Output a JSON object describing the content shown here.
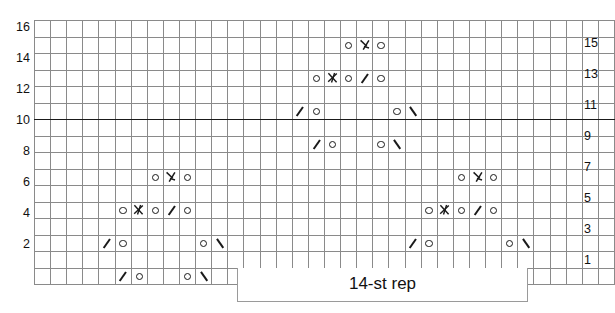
{
  "chart": {
    "type": "knitting-chart-grid",
    "columns": 36,
    "rows": 16,
    "heavy_vertical_after_columns": [
      10,
      23
    ],
    "heavy_horizontal_below_row": 11,
    "grid_color": "#8a8a8a",
    "border_color": "#1a1a1a",
    "row_labels_left": [
      "16",
      "14",
      "12",
      "10",
      "8",
      "6",
      "4",
      "2"
    ],
    "row_labels_right": [
      "15",
      "13",
      "11",
      "9",
      "7",
      "5",
      "3",
      "1"
    ],
    "symbol_legend": {
      "yo": "yarn-over-circle",
      "dec_l": "left-leaning-decrease-backslash",
      "dec_r": "right-leaning-decrease-slash",
      "cdd": "centered-double-decrease-lambda",
      "k3tog": "three-stitch-decrease-arrow"
    },
    "cells": [
      {
        "row": 16,
        "symbols": []
      },
      {
        "row": 15,
        "symbols": [
          {
            "col": 20,
            "type": "yo"
          },
          {
            "col": 21,
            "type": "cdd"
          },
          {
            "col": 22,
            "type": "yo"
          }
        ]
      },
      {
        "row": 14,
        "symbols": []
      },
      {
        "row": 13,
        "symbols": [
          {
            "col": 18,
            "type": "yo"
          },
          {
            "col": 19,
            "type": "k3tog"
          },
          {
            "col": 20,
            "type": "yo"
          },
          {
            "col": 21,
            "type": "dec_l"
          },
          {
            "col": 22,
            "type": "yo"
          }
        ]
      },
      {
        "row": 12,
        "symbols": []
      },
      {
        "row": 11,
        "symbols": [
          {
            "col": 17,
            "type": "dec_l"
          },
          {
            "col": 18,
            "type": "yo"
          },
          {
            "col": 23,
            "type": "yo"
          },
          {
            "col": 24,
            "type": "dec_r"
          }
        ]
      },
      {
        "row": 10,
        "symbols": []
      },
      {
        "row": 9,
        "symbols": [
          {
            "col": 18,
            "type": "dec_l"
          },
          {
            "col": 19,
            "type": "yo"
          },
          {
            "col": 22,
            "type": "yo"
          },
          {
            "col": 23,
            "type": "dec_r"
          }
        ]
      },
      {
        "row": 8,
        "symbols": []
      },
      {
        "row": 7,
        "symbols": [
          {
            "col": 8,
            "type": "yo"
          },
          {
            "col": 9,
            "type": "cdd"
          },
          {
            "col": 10,
            "type": "yo"
          },
          {
            "col": 27,
            "type": "yo"
          },
          {
            "col": 28,
            "type": "cdd"
          },
          {
            "col": 29,
            "type": "yo"
          }
        ]
      },
      {
        "row": 6,
        "symbols": []
      },
      {
        "row": 5,
        "symbols": [
          {
            "col": 6,
            "type": "yo"
          },
          {
            "col": 7,
            "type": "k3tog"
          },
          {
            "col": 8,
            "type": "yo"
          },
          {
            "col": 9,
            "type": "dec_l"
          },
          {
            "col": 10,
            "type": "yo"
          },
          {
            "col": 25,
            "type": "yo"
          },
          {
            "col": 26,
            "type": "k3tog"
          },
          {
            "col": 27,
            "type": "yo"
          },
          {
            "col": 28,
            "type": "dec_l"
          },
          {
            "col": 29,
            "type": "yo"
          }
        ]
      },
      {
        "row": 4,
        "symbols": []
      },
      {
        "row": 3,
        "symbols": [
          {
            "col": 5,
            "type": "dec_l"
          },
          {
            "col": 6,
            "type": "yo"
          },
          {
            "col": 11,
            "type": "yo"
          },
          {
            "col": 12,
            "type": "dec_r"
          },
          {
            "col": 24,
            "type": "dec_l"
          },
          {
            "col": 25,
            "type": "yo"
          },
          {
            "col": 30,
            "type": "yo"
          },
          {
            "col": 31,
            "type": "dec_r"
          }
        ]
      },
      {
        "row": 2,
        "symbols": []
      },
      {
        "row": 1,
        "symbols": [
          {
            "col": 6,
            "type": "dec_l"
          },
          {
            "col": 7,
            "type": "yo"
          },
          {
            "col": 10,
            "type": "yo"
          },
          {
            "col": 11,
            "type": "dec_r"
          },
          {
            "col": 25,
            "type": "dec_l"
          },
          {
            "col": 26,
            "type": "yo"
          },
          {
            "col": 29,
            "type": "yo"
          },
          {
            "col": 30,
            "type": "dec_r"
          }
        ]
      }
    ]
  },
  "repeat": {
    "label": "14-st rep",
    "start_column": 14,
    "end_column": 33
  },
  "chart_data": {
    "type": "table",
    "title": "",
    "xlabel": "",
    "ylabel": "",
    "categories": [
      "1",
      "2",
      "3",
      "4",
      "5",
      "6",
      "7",
      "8",
      "9",
      "10",
      "11",
      "12",
      "13",
      "14",
      "15",
      "16",
      "17",
      "18",
      "19",
      "20",
      "21",
      "22",
      "23",
      "24",
      "25",
      "26",
      "27",
      "28",
      "29",
      "30",
      "31",
      "32",
      "33",
      "34",
      "35",
      "36"
    ],
    "series": [
      {
        "name": "row 16",
        "values": [
          "",
          "",
          "",
          "",
          "",
          "",
          "",
          "",
          "",
          "",
          "",
          "",
          "",
          "",
          "",
          "",
          "",
          "",
          "",
          "",
          "",
          "",
          "",
          "",
          "",
          "",
          "",
          "",
          "",
          "",
          "",
          "",
          "",
          "",
          "",
          ""
        ]
      },
      {
        "name": "row 15",
        "values": [
          "",
          "",
          "",
          "",
          "",
          "",
          "",
          "",
          "",
          "",
          "",
          "",
          "",
          "",
          "",
          "",
          "",
          "",
          "",
          "yo",
          "cdd",
          "yo",
          "",
          "",
          "",
          "",
          "",
          "",
          "",
          "",
          "",
          "",
          "",
          "",
          "",
          ""
        ]
      },
      {
        "name": "row 14",
        "values": [
          "",
          "",
          "",
          "",
          "",
          "",
          "",
          "",
          "",
          "",
          "",
          "",
          "",
          "",
          "",
          "",
          "",
          "",
          "",
          "",
          "",
          "",
          "",
          "",
          "",
          "",
          "",
          "",
          "",
          "",
          "",
          "",
          "",
          "",
          "",
          ""
        ]
      },
      {
        "name": "row 13",
        "values": [
          "",
          "",
          "",
          "",
          "",
          "",
          "",
          "",
          "",
          "",
          "",
          "",
          "",
          "",
          "",
          "",
          "",
          "yo",
          "k3tog",
          "yo",
          "dec_l",
          "yo",
          "",
          "",
          "",
          "",
          "",
          "",
          "",
          "",
          "",
          "",
          "",
          "",
          "",
          ""
        ]
      },
      {
        "name": "row 12",
        "values": [
          "",
          "",
          "",
          "",
          "",
          "",
          "",
          "",
          "",
          "",
          "",
          "",
          "",
          "",
          "",
          "",
          "",
          "",
          "",
          "",
          "",
          "",
          "",
          "",
          "",
          "",
          "",
          "",
          "",
          "",
          "",
          "",
          "",
          "",
          "",
          ""
        ]
      },
      {
        "name": "row 11",
        "values": [
          "",
          "",
          "",
          "",
          "",
          "",
          "",
          "",
          "",
          "",
          "",
          "",
          "",
          "",
          "",
          "",
          "dec_l",
          "yo",
          "",
          "",
          "",
          "",
          "yo",
          "dec_r",
          "",
          "",
          "",
          "",
          "",
          "",
          "",
          "",
          "",
          "",
          "",
          ""
        ]
      },
      {
        "name": "row 10",
        "values": [
          "",
          "",
          "",
          "",
          "",
          "",
          "",
          "",
          "",
          "",
          "",
          "",
          "",
          "",
          "",
          "",
          "",
          "",
          "",
          "",
          "",
          "",
          "",
          "",
          "",
          "",
          "",
          "",
          "",
          "",
          "",
          "",
          "",
          "",
          "",
          ""
        ]
      },
      {
        "name": "row 9",
        "values": [
          "",
          "",
          "",
          "",
          "",
          "",
          "",
          "",
          "",
          "",
          "",
          "",
          "",
          "",
          "",
          "",
          "",
          "dec_l",
          "yo",
          "",
          "",
          "yo",
          "dec_r",
          "",
          "",
          "",
          "",
          "",
          "",
          "",
          "",
          "",
          "",
          "",
          "",
          ""
        ]
      },
      {
        "name": "row 8",
        "values": [
          "",
          "",
          "",
          "",
          "",
          "",
          "",
          "",
          "",
          "",
          "",
          "",
          "",
          "",
          "",
          "",
          "",
          "",
          "",
          "",
          "",
          "",
          "",
          "",
          "",
          "",
          "",
          "",
          "",
          "",
          "",
          "",
          "",
          "",
          "",
          ""
        ]
      },
      {
        "name": "row 7",
        "values": [
          "",
          "",
          "",
          "",
          "",
          "",
          "",
          "yo",
          "cdd",
          "yo",
          "",
          "",
          "",
          "",
          "",
          "",
          "",
          "",
          "",
          "",
          "",
          "",
          "",
          "",
          "",
          "",
          "yo",
          "cdd",
          "yo",
          "",
          "",
          "",
          "",
          "",
          "",
          ""
        ]
      },
      {
        "name": "row 6",
        "values": [
          "",
          "",
          "",
          "",
          "",
          "",
          "",
          "",
          "",
          "",
          "",
          "",
          "",
          "",
          "",
          "",
          "",
          "",
          "",
          "",
          "",
          "",
          "",
          "",
          "",
          "",
          "",
          "",
          "",
          "",
          "",
          "",
          "",
          "",
          "",
          ""
        ]
      },
      {
        "name": "row 5",
        "values": [
          "",
          "",
          "",
          "",
          "",
          "yo",
          "k3tog",
          "yo",
          "dec_l",
          "yo",
          "",
          "",
          "",
          "",
          "",
          "",
          "",
          "",
          "",
          "",
          "",
          "",
          "",
          "",
          "yo",
          "k3tog",
          "yo",
          "dec_l",
          "yo",
          "",
          "",
          "",
          "",
          "",
          "",
          ""
        ]
      },
      {
        "name": "row 4",
        "values": [
          "",
          "",
          "",
          "",
          "",
          "",
          "",
          "",
          "",
          "",
          "",
          "",
          "",
          "",
          "",
          "",
          "",
          "",
          "",
          "",
          "",
          "",
          "",
          "",
          "",
          "",
          "",
          "",
          "",
          "",
          "",
          "",
          "",
          "",
          "",
          ""
        ]
      },
      {
        "name": "row 3",
        "values": [
          "",
          "",
          "",
          "",
          "dec_l",
          "yo",
          "",
          "",
          "",
          "",
          "yo",
          "dec_r",
          "",
          "",
          "",
          "",
          "",
          "",
          "",
          "",
          "",
          "",
          "",
          "dec_l",
          "yo",
          "",
          "",
          "",
          "",
          "yo",
          "dec_r",
          "",
          "",
          "",
          "",
          ""
        ]
      },
      {
        "name": "row 2",
        "values": [
          "",
          "",
          "",
          "",
          "",
          "",
          "",
          "",
          "",
          "",
          "",
          "",
          "",
          "",
          "",
          "",
          "",
          "",
          "",
          "",
          "",
          "",
          "",
          "",
          "",
          "",
          "",
          "",
          "",
          "",
          "",
          "",
          "",
          "",
          "",
          ""
        ]
      },
      {
        "name": "row 1",
        "values": [
          "",
          "",
          "",
          "",
          "",
          "dec_l",
          "yo",
          "",
          "",
          "yo",
          "dec_r",
          "",
          "",
          "",
          "",
          "",
          "",
          "",
          "",
          "",
          "",
          "",
          "",
          "",
          "dec_l",
          "yo",
          "",
          "",
          "yo",
          "dec_r",
          "",
          "",
          "",
          "",
          "",
          ""
        ]
      }
    ]
  }
}
